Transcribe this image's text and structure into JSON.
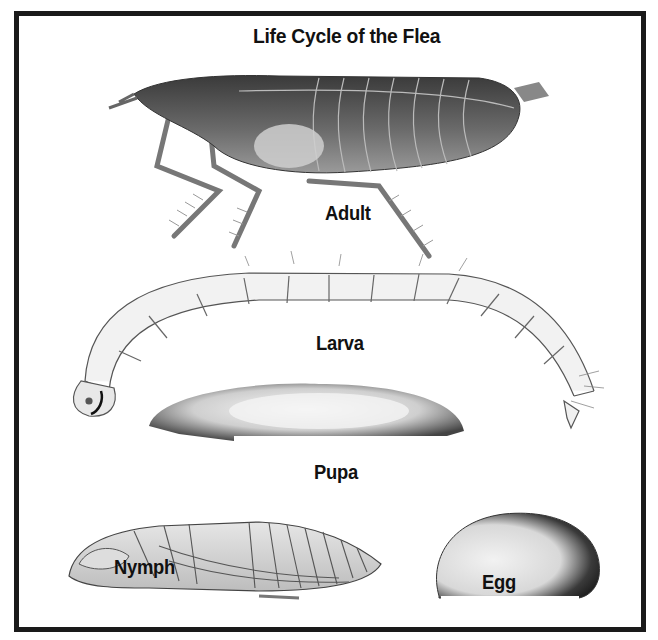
{
  "diagram": {
    "title": "Life Cycle of the Flea",
    "stages": [
      {
        "id": "adult",
        "label": "Adult"
      },
      {
        "id": "larva",
        "label": "Larva"
      },
      {
        "id": "pupa",
        "label": "Pupa"
      },
      {
        "id": "nymph",
        "label": "Nymph"
      },
      {
        "id": "egg",
        "label": "Egg"
      }
    ],
    "colors": {
      "border": "#1a1a1a",
      "background": "#ffffff",
      "ink": "#111111"
    }
  }
}
